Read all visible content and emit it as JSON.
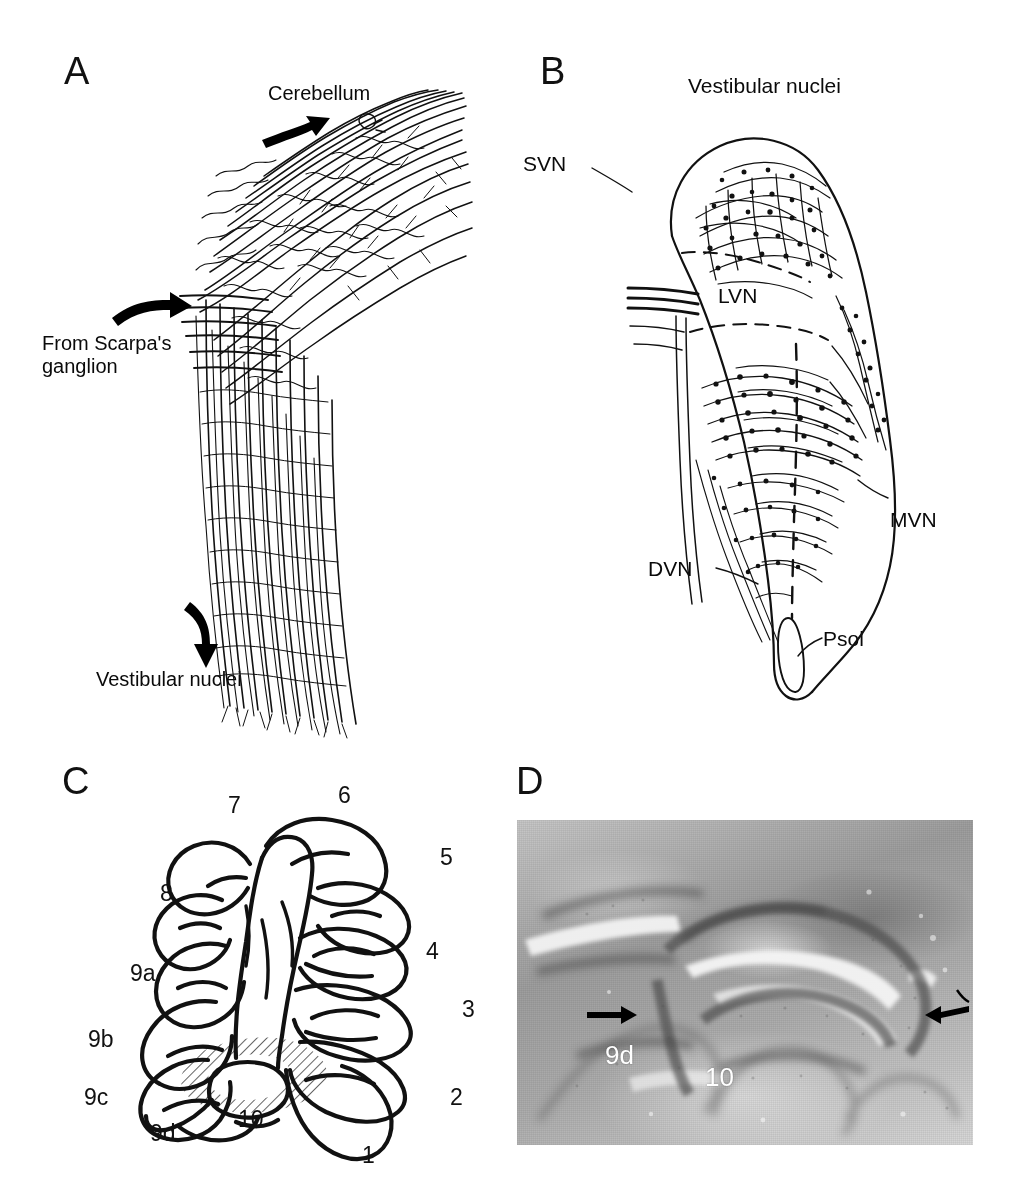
{
  "figure": {
    "background_color": "#ffffff",
    "ink_color": "#000000",
    "panels": [
      {
        "letter": "A",
        "type": "line-drawing",
        "description": "Camera lucida drawing of vestibular primary afferent fibers",
        "labels": [
          {
            "name": "cerebellum-label",
            "text": "Cerebellum"
          },
          {
            "name": "from-scarpas-ganglion-label",
            "text": "From Scarpa's\nganglion"
          },
          {
            "name": "vestibular-nuclei-label",
            "text": "Vestibular nuclei"
          }
        ],
        "arrows": [
          {
            "name": "arrow-to-cerebellum",
            "direction": "up-right"
          },
          {
            "name": "arrow-from-scarpas-ganglion",
            "direction": "right"
          },
          {
            "name": "arrow-to-vestibular-nuclei",
            "direction": "down"
          }
        ]
      },
      {
        "letter": "B",
        "type": "line-drawing",
        "description": "Outline of the vestibular nuclear complex with labeled afferent terminal fields",
        "title": "Vestibular nuclei",
        "labels": [
          {
            "name": "svn-label",
            "text": "SVN",
            "full": "superior vestibular nucleus"
          },
          {
            "name": "lvn-label",
            "text": "LVN",
            "full": "lateral vestibular nucleus"
          },
          {
            "name": "mvn-label",
            "text": "MVN",
            "full": "medial vestibular nucleus"
          },
          {
            "name": "dvn-label",
            "text": "DVN",
            "full": "descending vestibular nucleus"
          },
          {
            "name": "psol-label",
            "text": "Psol",
            "full": "parasolitary nucleus"
          }
        ]
      },
      {
        "letter": "C",
        "type": "line-drawing",
        "description": "Sagittal outline of the cerebellar vermis showing lobules; hatching marks the nodulus / uvula region",
        "lobule_labels": [
          "1",
          "2",
          "3",
          "4",
          "5",
          "6",
          "7",
          "8",
          "9a",
          "9b",
          "9c",
          "9d",
          "10"
        ],
        "shaded_region": "hatched area spanning lobules 9d and 10"
      },
      {
        "letter": "D",
        "type": "photomicrograph",
        "description": "Grayscale histological section of the caudal cerebellar vermis",
        "labels": [
          {
            "name": "lobule-9d-label",
            "text": "9d",
            "color": "#ffffff"
          },
          {
            "name": "lobule-10-label",
            "text": "10",
            "color": "#ffffff"
          }
        ],
        "arrows": [
          {
            "name": "left-arrow-marker",
            "direction": "right"
          },
          {
            "name": "right-arrow-marker",
            "direction": "left"
          }
        ]
      }
    ]
  }
}
